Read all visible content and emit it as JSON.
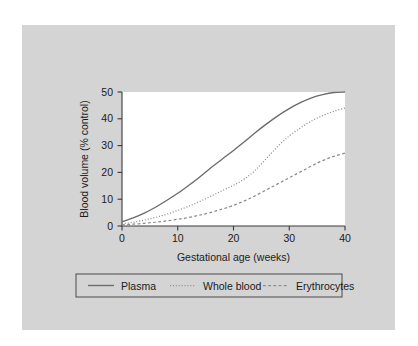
{
  "figure": {
    "background_color": "#d4d4d4",
    "plot_background_color": "#ffffff",
    "page_background_color": "#ffffff"
  },
  "chart_data": {
    "type": "line",
    "title": "",
    "xlabel": "Gestational age (weeks)",
    "ylabel": "Blood volume (% control)",
    "xlim": [
      0,
      40
    ],
    "ylim": [
      0,
      50
    ],
    "xticks": [
      "0",
      "10",
      "20",
      "30",
      "40"
    ],
    "yticks": [
      "0",
      "10",
      "20",
      "30",
      "40",
      "50"
    ],
    "grid": false,
    "legend_position": "below-axes",
    "x": [
      0,
      2,
      4,
      6,
      8,
      10,
      12,
      14,
      16,
      18,
      20,
      22,
      24,
      26,
      28,
      30,
      32,
      34,
      36,
      38,
      40
    ],
    "series": [
      {
        "name": "Plasma",
        "style": "solid",
        "color": "#6b6b6b",
        "values": [
          1.5,
          3.0,
          4.8,
          7.0,
          9.5,
          12.2,
          15.2,
          18.4,
          21.8,
          25.0,
          28.2,
          31.5,
          35.0,
          38.2,
          41.2,
          43.8,
          46.0,
          47.8,
          49.0,
          49.8,
          50.0
        ]
      },
      {
        "name": "Whole blood",
        "style": "dotted",
        "color": "#8a8a8a",
        "values": [
          0.8,
          1.4,
          2.2,
          3.2,
          4.4,
          5.8,
          7.4,
          9.2,
          11.2,
          13.2,
          15.2,
          17.6,
          21.0,
          25.4,
          29.8,
          33.6,
          36.6,
          39.2,
          41.2,
          42.8,
          44.0
        ]
      },
      {
        "name": "Erythrocytes",
        "style": "dashed",
        "color": "#8a8a8a",
        "values": [
          0.4,
          0.7,
          1.0,
          1.4,
          1.9,
          2.5,
          3.2,
          4.1,
          5.1,
          6.3,
          7.7,
          9.4,
          11.4,
          13.6,
          15.8,
          18.0,
          20.2,
          22.4,
          24.4,
          26.0,
          27.2
        ]
      }
    ]
  },
  "legend": {
    "entries": [
      {
        "label": "Plasma",
        "style": "solid"
      },
      {
        "label": "Whole blood",
        "style": "dotted"
      },
      {
        "label": "Erythrocytes",
        "style": "dashed"
      }
    ]
  }
}
